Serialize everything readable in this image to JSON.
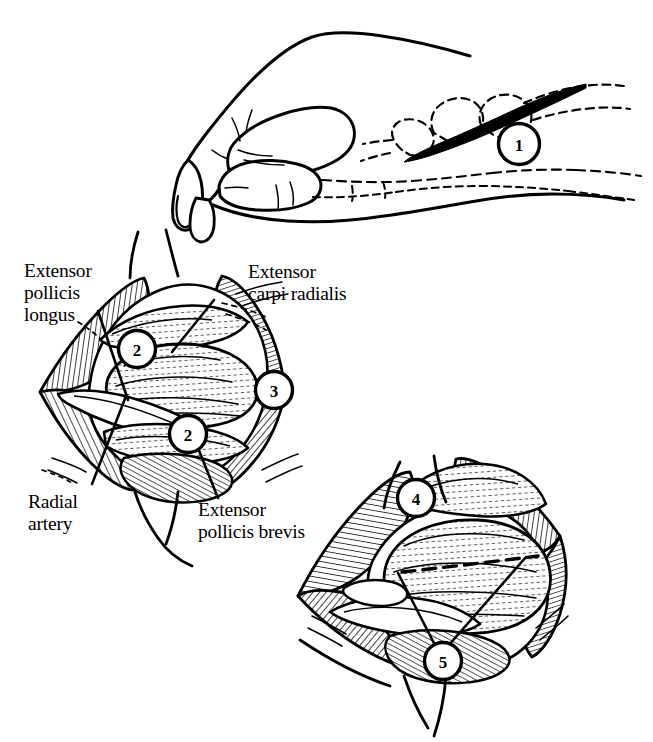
{
  "figure": {
    "background_color": "#ffffff",
    "ink_color": "#000000",
    "panels": [
      {
        "id": "panel-hand",
        "name": "hand-incision-view",
        "caption": "Lateral view of hand with skin incision marked over the anatomical snuffbox",
        "markers": [
          {
            "number": "1",
            "meaning": "skin incision"
          }
        ]
      },
      {
        "id": "panel-superficial",
        "name": "superficial-dissection-view",
        "caption": "Superficial dissection showing tendons and radial artery",
        "markers": [
          {
            "number": "2",
            "meaning": "retracted tendon"
          },
          {
            "number": "2",
            "meaning": "retracted tendon"
          },
          {
            "number": "3",
            "meaning": "deep exposure"
          }
        ]
      },
      {
        "id": "panel-deep",
        "name": "deep-dissection-view",
        "caption": "Deep dissection with capsular incision line",
        "markers": [
          {
            "number": "4",
            "meaning": "retracted structure"
          },
          {
            "number": "5",
            "meaning": "capsular incision"
          }
        ]
      }
    ],
    "labels": [
      {
        "id": "epl",
        "lines": [
          "Extensor",
          "pollicis",
          "longus"
        ]
      },
      {
        "id": "ecr",
        "lines": [
          "Extensor",
          "carpi radialis"
        ]
      },
      {
        "id": "ra",
        "lines": [
          "Radial",
          "artery"
        ]
      },
      {
        "id": "epb",
        "lines": [
          "Extensor",
          "pollicis brevis"
        ]
      }
    ],
    "markers": [
      {
        "id": "m1",
        "text": "1"
      },
      {
        "id": "m2a",
        "text": "2"
      },
      {
        "id": "m2b",
        "text": "2"
      },
      {
        "id": "m3",
        "text": "3"
      },
      {
        "id": "m4",
        "text": "4"
      },
      {
        "id": "m5",
        "text": "5"
      }
    ]
  }
}
